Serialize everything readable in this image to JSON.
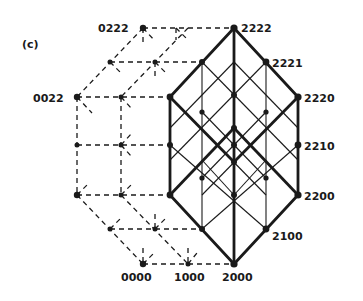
{
  "panel_label": "(c)",
  "colors": {
    "ink": "#1a1a1a",
    "background": "#ffffff"
  },
  "labels": {
    "n2222": "2222",
    "n2221": "2221",
    "n2220": "2220",
    "n2210": "2210",
    "n2200": "2200",
    "n2100": "2100",
    "n2000": "2000",
    "n1000": "1000",
    "n0000": "0000",
    "n0022": "0022",
    "n0222": "0222"
  }
}
